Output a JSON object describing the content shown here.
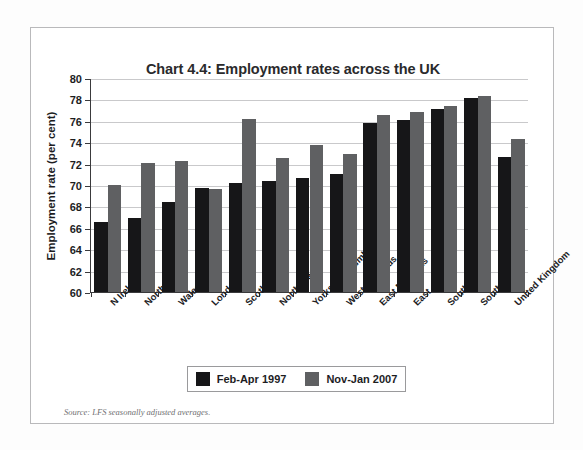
{
  "chart_data": {
    "type": "bar",
    "title": "Chart 4.4: Employment rates across the UK",
    "xlabel": "",
    "ylabel": "Employment rate (per cent)",
    "ylim": [
      60,
      80
    ],
    "ytick_step": 2,
    "yticks": [
      80,
      78,
      76,
      74,
      72,
      70,
      68,
      66,
      64,
      62,
      60
    ],
    "grid": true,
    "legend_position": "below-plot",
    "categories": [
      "N Ireland",
      "North East",
      "Wales",
      "London",
      "Scotland",
      "North West",
      "Yorks and Humber",
      "West Midlands",
      "East Midlands",
      "East",
      "South West",
      "South East",
      "United Kingdom"
    ],
    "series": [
      {
        "name": "Feb-Apr 1997",
        "color": "#161618",
        "values": [
          66.5,
          66.9,
          68.4,
          69.7,
          70.2,
          70.4,
          70.7,
          71.0,
          75.8,
          76.1,
          77.1,
          78.1,
          72.6
        ]
      },
      {
        "name": "Nov-Jan 2007",
        "color": "#5f6062",
        "values": [
          70.0,
          72.1,
          72.2,
          69.6,
          76.2,
          72.5,
          73.7,
          72.9,
          76.5,
          76.8,
          77.4,
          78.3,
          74.3
        ]
      }
    ],
    "source_note": "Source: LFS seasonally adjusted averages."
  }
}
